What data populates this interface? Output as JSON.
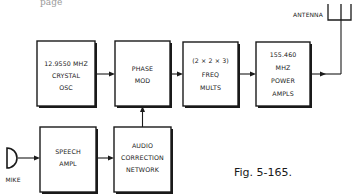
{
  "page_fragment": "page",
  "caption": "Fig. 5-165.",
  "blocks": {
    "crystal_osc": [
      "12.9550 MHZ",
      "CRYSTAL",
      "OSC"
    ],
    "phase_mod": [
      "PHASE",
      "MOD"
    ],
    "freq_mults": [
      "(2 × 2 × 3)",
      "FREQ",
      "MULTS"
    ],
    "power_amps": [
      "155.460",
      "MHZ",
      "POWER",
      "AMPLS"
    ],
    "speech_ampl": [
      "SPEECH",
      "AMPL"
    ],
    "audio_correction": [
      "AUDIO",
      "CORRECTION",
      "NETWORK"
    ]
  },
  "labels": {
    "antenna": "ANTENNA",
    "mike": "MIKE"
  },
  "connections": [
    {
      "from": "crystal_osc",
      "to": "phase_mod"
    },
    {
      "from": "phase_mod",
      "to": "freq_mults"
    },
    {
      "from": "freq_mults",
      "to": "power_amps"
    },
    {
      "from": "power_amps",
      "to": "antenna"
    },
    {
      "from": "mike",
      "to": "speech_ampl"
    },
    {
      "from": "speech_ampl",
      "to": "audio_correction"
    },
    {
      "from": "audio_correction",
      "to": "phase_mod"
    }
  ]
}
